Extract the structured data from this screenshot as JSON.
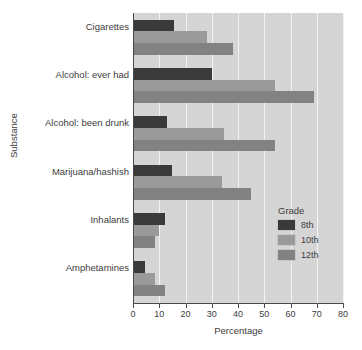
{
  "chart_data": {
    "type": "bar",
    "orientation": "horizontal",
    "title": "",
    "xlabel": "Percentage",
    "ylabel": "Substance",
    "xlim": [
      0,
      80
    ],
    "xticks": [
      0,
      10,
      20,
      30,
      40,
      50,
      60,
      70,
      80
    ],
    "xtick_labels": [
      "0",
      "10",
      "20",
      "30",
      "40",
      "50",
      "60",
      "70",
      "80"
    ],
    "grid": "vertical",
    "categories": [
      "Cigarettes",
      "Alcohol: ever had",
      "Alcohol: been drunk",
      "Marijuana/hashish",
      "Inhalants",
      "Amphetamines"
    ],
    "series": [
      {
        "name": "8th",
        "color": "#3a3a3a",
        "values": [
          15.5,
          30,
          13,
          15,
          12,
          4.5
        ]
      },
      {
        "name": "10th",
        "color": "#9a9a9a",
        "values": [
          28,
          54,
          34.5,
          34,
          10,
          8.5
        ]
      },
      {
        "name": "12th",
        "color": "#828282",
        "values": [
          38,
          69,
          54,
          45,
          8.5,
          12
        ]
      }
    ],
    "legend": {
      "title": "Grade",
      "position": "inside-right-lower",
      "entries": [
        {
          "label": "8th",
          "color": "#3a3a3a"
        },
        {
          "label": "10th",
          "color": "#9a9a9a"
        },
        {
          "label": "12th",
          "color": "#828282"
        }
      ]
    },
    "plot_background": "#d5d5d5",
    "gridline_color": "#f2f2f2",
    "axis_color": "#4a4a4a"
  }
}
